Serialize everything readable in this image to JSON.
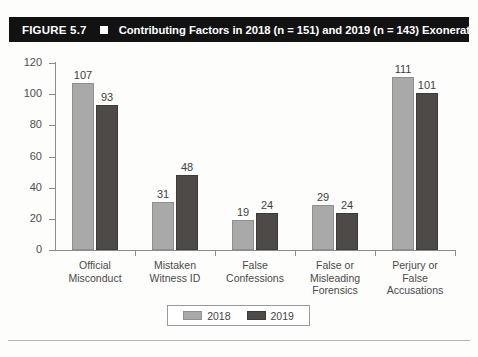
{
  "figure": {
    "number_label": "FIGURE 5.7",
    "marker_icon": "filled-square-icon",
    "title": "Contributing Factors in 2018 (n = 151) and 2019 (n = 143) Exonerations"
  },
  "colors": {
    "series_2018": "#a9a9a9",
    "series_2019": "#4e4a48",
    "title_bar_background": "#121212",
    "title_text": "#ffffff",
    "axis": "#8c8c8c"
  },
  "chart_data": {
    "type": "bar",
    "title": "Contributing Factors in 2018 (n = 151) and 2019 (n = 143) Exonerations",
    "xlabel": "",
    "ylabel": "",
    "ylim": [
      0,
      120
    ],
    "yticks": [
      0,
      20,
      40,
      60,
      80,
      100,
      120
    ],
    "ytick_labels": [
      "0",
      "20",
      "40",
      "60",
      "80",
      "100",
      "120"
    ],
    "grid": false,
    "legend_position": "bottom-center",
    "categories": [
      "Official\nMisconduct",
      "Mistaken\nWitness ID",
      "False\nConfessions",
      "False or\nMisleading\nForensics",
      "Perjury or\nFalse\nAccusations"
    ],
    "series": [
      {
        "name": "2018",
        "color": "#a9a9a9",
        "values": [
          107,
          31,
          19,
          29,
          111
        ],
        "value_labels": [
          "107",
          "31",
          "19",
          "29",
          "111"
        ]
      },
      {
        "name": "2019",
        "color": "#4e4a48",
        "values": [
          93,
          48,
          24,
          24,
          101
        ],
        "value_labels": [
          "93",
          "48",
          "24",
          "24",
          "101"
        ]
      }
    ]
  },
  "legend": {
    "entries": [
      {
        "label": "2018"
      },
      {
        "label": "2019"
      }
    ]
  }
}
